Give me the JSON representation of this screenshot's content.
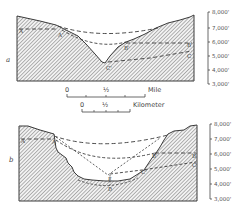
{
  "colors": {
    "ink": "#3a3a3a",
    "hatch": "#8a8a8a",
    "background": "#ffffff"
  },
  "diagram_a": {
    "panel_label": "a",
    "point_labels": {
      "A_left": "A",
      "A_right": "A'",
      "B_left": "B'",
      "B_right": "B",
      "C_left": "C'",
      "C_right": "C"
    },
    "elevation_scale": [
      "8,000'",
      "7,000'",
      "6,000'",
      "5,000'",
      "4,000'",
      "3,000'"
    ]
  },
  "scale_bars": {
    "mile": {
      "start": "0",
      "mid": "½",
      "unit": "Mile"
    },
    "kilometer": {
      "start": "0",
      "mid": "½",
      "unit": "Kilometer"
    }
  },
  "diagram_b": {
    "panel_label": "b",
    "point_labels": {
      "A_left": "A",
      "A_right": "A'",
      "B_left": "B'",
      "B_right": "B",
      "C_left": "C'",
      "C_right": "C",
      "D_top": "E",
      "D_bottom": "D"
    },
    "elevation_scale": [
      "8,000'",
      "7,000'",
      "6,000'",
      "5,000'",
      "4,000'",
      "3,000'"
    ]
  }
}
